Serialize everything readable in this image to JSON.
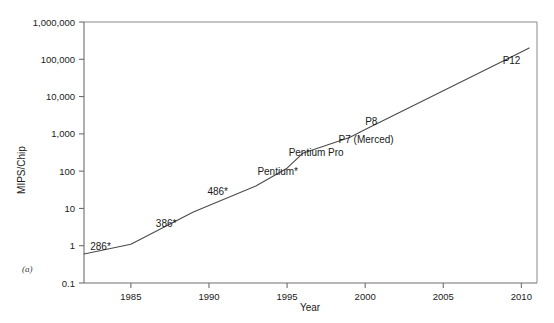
{
  "figure": {
    "panel_label": "(a)",
    "background": "#ffffff",
    "line_color": "#4a4a4a",
    "axis_color": "#6e6e6e"
  },
  "chart_data": {
    "type": "line",
    "title": "",
    "xlabel": "Year",
    "ylabel": "MIPS/Chip",
    "xlim": [
      1982,
      2011
    ],
    "ylim": [
      0.1,
      1000000
    ],
    "yscale": "log",
    "grid": false,
    "legend": "none",
    "xticks": [
      "1985",
      "1990",
      "1995",
      "2000",
      "2005",
      "2010"
    ],
    "xtick_values": [
      1985,
      1990,
      1995,
      2000,
      2005,
      2010
    ],
    "yticks": [
      "0.1",
      "1",
      "10",
      "100",
      "1,000",
      "10,000",
      "100,000",
      "1,000,000"
    ],
    "ytick_values": [
      0.1,
      1,
      10,
      100,
      1000,
      10000,
      100000,
      1000000
    ],
    "series": [
      {
        "name": "MIPS/Chip",
        "x": [
          1982,
          1985,
          1989,
          1993,
          1995,
          1996,
          1999,
          2000,
          2010.5
        ],
        "y": [
          0.6,
          1.1,
          8,
          40,
          120,
          300,
          800,
          1300,
          200000
        ]
      }
    ],
    "annotations": [
      {
        "text": "286*",
        "x": 1982.4,
        "y": 0.75,
        "anchor": "start"
      },
      {
        "text": "386*",
        "x": 1986.6,
        "y": 3.2,
        "anchor": "start"
      },
      {
        "text": "486*",
        "x": 1989.9,
        "y": 23,
        "anchor": "start"
      },
      {
        "text": "Pentium*",
        "x": 1993.1,
        "y": 78,
        "anchor": "start"
      },
      {
        "text": "Pentium Pro",
        "x": 1995.1,
        "y": 260,
        "anchor": "start"
      },
      {
        "text": "P7 (Merced)",
        "x": 1998.3,
        "y": 560,
        "anchor": "start"
      },
      {
        "text": "P8",
        "x": 2000.0,
        "y": 1700,
        "anchor": "start"
      },
      {
        "text": "P12",
        "x": 2008.8,
        "y": 75000,
        "anchor": "start"
      }
    ]
  }
}
